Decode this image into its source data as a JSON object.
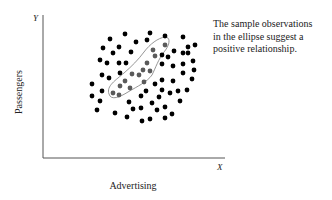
{
  "chart_data": {
    "type": "scatter",
    "title": "",
    "xlabel": "Advertising",
    "ylabel": "Passengers",
    "x_axis_letter": "X",
    "y_axis_letter": "Y",
    "grid": false,
    "ticks": "none",
    "annotation": [
      "The sample observations",
      "in the ellipse suggest a",
      "positive relationship."
    ],
    "series": [
      {
        "name": "all observations",
        "color": "#000000",
        "points": [
          [
            110,
            39
          ],
          [
            125,
            34
          ],
          [
            150,
            33
          ],
          [
            165,
            36
          ],
          [
            183,
            37
          ],
          [
            103,
            48
          ],
          [
            119,
            47
          ],
          [
            136,
            42
          ],
          [
            147,
            40
          ],
          [
            113,
            53
          ],
          [
            131,
            52
          ],
          [
            188,
            47
          ],
          [
            195,
            45
          ],
          [
            188,
            53
          ],
          [
            100,
            60
          ],
          [
            107,
            63
          ],
          [
            119,
            63
          ],
          [
            126,
            63
          ],
          [
            162,
            55
          ],
          [
            168,
            57
          ],
          [
            174,
            51
          ],
          [
            183,
            53
          ],
          [
            193,
            61
          ],
          [
            102,
            75
          ],
          [
            109,
            78
          ],
          [
            120,
            73
          ],
          [
            162,
            64
          ],
          [
            173,
            66
          ],
          [
            183,
            64
          ],
          [
            194,
            70
          ],
          [
            92,
            84
          ],
          [
            162,
            80
          ],
          [
            173,
            81
          ],
          [
            183,
            73
          ],
          [
            192,
            79
          ],
          [
            92,
            96
          ],
          [
            102,
            91
          ],
          [
            155,
            84
          ],
          [
            146,
            91
          ],
          [
            141,
            96
          ],
          [
            162,
            90
          ],
          [
            170,
            93
          ],
          [
            178,
            91
          ],
          [
            187,
            90
          ],
          [
            100,
            101
          ],
          [
            97,
            110
          ],
          [
            115,
            113
          ],
          [
            129,
            102
          ],
          [
            133,
            109
          ],
          [
            141,
            108
          ],
          [
            152,
            103
          ],
          [
            159,
            97
          ],
          [
            165,
            107
          ],
          [
            157,
            110
          ],
          [
            127,
            117
          ],
          [
            142,
            121
          ],
          [
            150,
            119
          ],
          [
            165,
            118
          ],
          [
            172,
            114
          ],
          [
            180,
            101
          ]
        ]
      },
      {
        "name": "observations in ellipse",
        "color": "#5a5a5a",
        "points": [
          [
            153,
            50
          ],
          [
            165,
            45
          ],
          [
            155,
            56
          ],
          [
            147,
            63
          ],
          [
            143,
            70
          ],
          [
            150,
            71
          ],
          [
            132,
            74
          ],
          [
            139,
            75
          ],
          [
            125,
            81
          ],
          [
            144,
            82
          ],
          [
            120,
            86
          ],
          [
            130,
            88
          ],
          [
            113,
            93
          ],
          [
            119,
            95
          ]
        ]
      }
    ],
    "ellipse": {
      "description": "Outline enclosing gray observations along positive diagonal",
      "stroke": "#8a8a8a"
    },
    "axes": {
      "origin_px": [
        43,
        158
      ],
      "x_end_px": 225,
      "y_top_px": 15
    }
  }
}
